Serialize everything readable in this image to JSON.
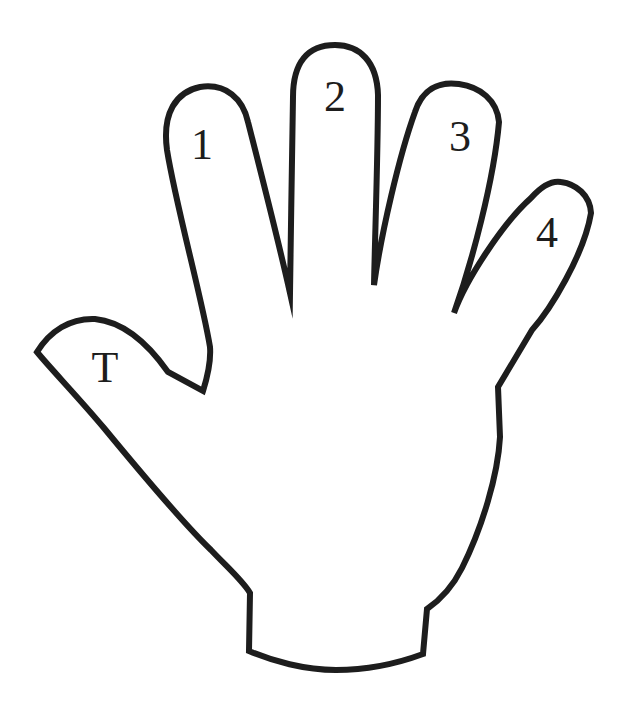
{
  "figure": {
    "background_color": "#ffffff",
    "outline_color": "#1d1d1d",
    "label_color": "#1d1d1d",
    "labels": {
      "thumb": "T",
      "finger1": "1",
      "finger2": "2",
      "finger3": "3",
      "finger4": "4"
    }
  }
}
